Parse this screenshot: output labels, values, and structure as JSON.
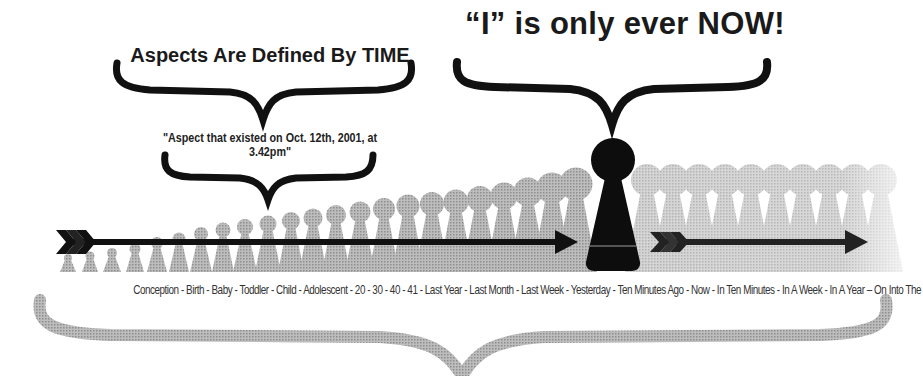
{
  "headings": {
    "left_title": "Aspects Are Defined By TIME",
    "right_title": "“I” is only ever NOW!",
    "aspect_quote": "\"Aspect that existed on Oct. 12th, 2001, at 3.42pm\""
  },
  "timeline": {
    "label": "Conception - Birth - Baby - Toddler - Child - Adolescent - 20 - 30 - 40 - 41 - Last Year - Last Month - Last Week - Yesterday - Ten Minutes Ago - Now - In Ten Minutes - In A Week - In A Year – On Into The Future ->>>",
    "stages": [
      "Conception",
      "Birth",
      "Baby",
      "Toddler",
      "Child",
      "Adolescent",
      "20",
      "30",
      "40",
      "41",
      "Last Year",
      "Last Month",
      "Last Week",
      "Yesterday",
      "Ten Minutes Ago",
      "Now",
      "In Ten Minutes",
      "In A Week",
      "In A Year",
      "On Into The Future ->>>"
    ]
  },
  "figures": {
    "past_count": 24,
    "future_count": 12,
    "now_figure": "I (now)"
  },
  "colors": {
    "ink": "#111111",
    "figure_gray": "#a8a8a8",
    "future_gray": "#c8c8c8",
    "brace_gray": "#b5b5b5"
  }
}
